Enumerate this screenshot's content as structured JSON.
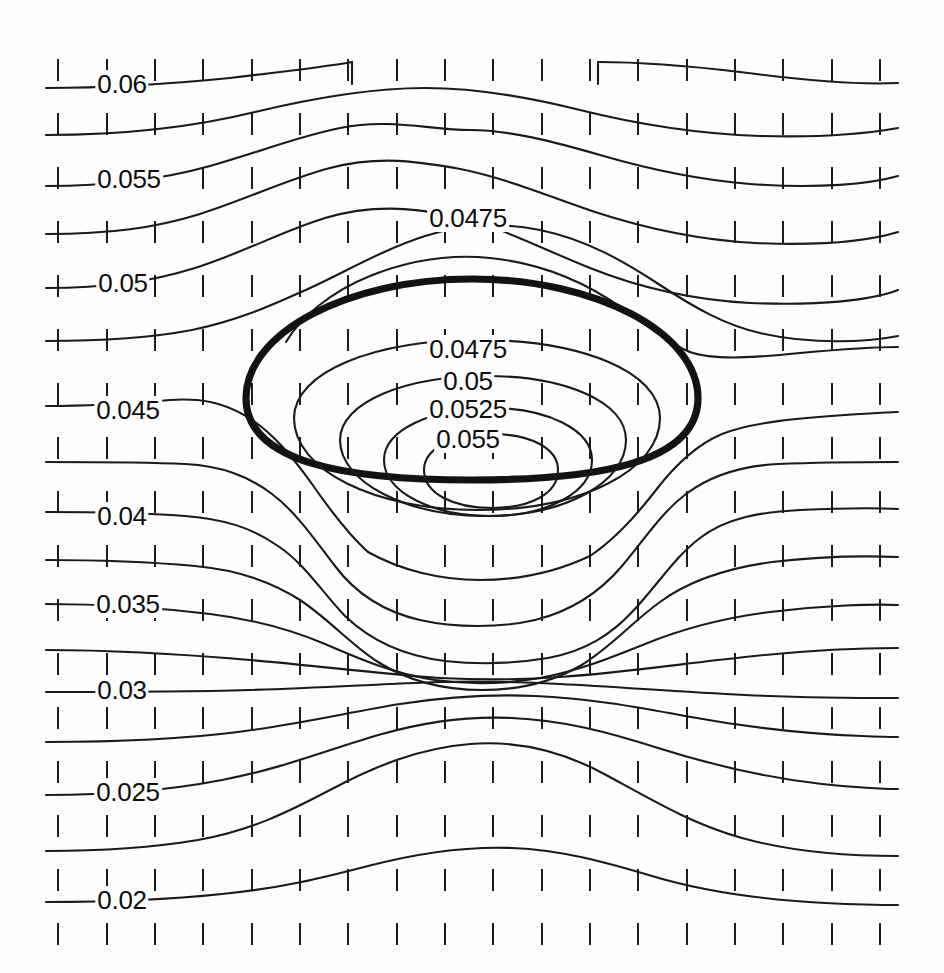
{
  "figure": {
    "type": "contour-plot",
    "background_color": "#fefefe",
    "line_color": "#1a1a1a",
    "bold_line_color": "#121212",
    "width": 944,
    "height": 973
  },
  "labels": [
    {
      "id": "lbl-0060",
      "text": "0.06",
      "x": 122,
      "y": 84,
      "value": 0.06
    },
    {
      "id": "lbl-0055",
      "text": "0.055",
      "x": 129,
      "y": 179,
      "value": 0.055
    },
    {
      "id": "lbl-0475a",
      "text": "0.0475",
      "x": 468,
      "y": 218,
      "value": 0.0475
    },
    {
      "id": "lbl-0050",
      "text": "0.05",
      "x": 123,
      "y": 283,
      "value": 0.05
    },
    {
      "id": "lbl-0475b",
      "text": "0.0475",
      "x": 468,
      "y": 349,
      "value": 0.0475
    },
    {
      "id": "lbl-0050b",
      "text": "0.05",
      "x": 468,
      "y": 381,
      "value": 0.05
    },
    {
      "id": "lbl-0045",
      "text": "0.045",
      "x": 128,
      "y": 410,
      "value": 0.045
    },
    {
      "id": "lbl-0525",
      "text": "0.0525",
      "x": 468,
      "y": 409,
      "value": 0.0525
    },
    {
      "id": "lbl-0550",
      "text": "0.055",
      "x": 468,
      "y": 439,
      "value": 0.055
    },
    {
      "id": "lbl-0040",
      "text": "0.04",
      "x": 122,
      "y": 516,
      "value": 0.04
    },
    {
      "id": "lbl-0035",
      "text": "0.035",
      "x": 128,
      "y": 604,
      "value": 0.035
    },
    {
      "id": "lbl-0030",
      "text": "0.03",
      "x": 122,
      "y": 690,
      "value": 0.03
    },
    {
      "id": "lbl-0025",
      "text": "0.025",
      "x": 128,
      "y": 792,
      "value": 0.025
    },
    {
      "id": "lbl-0020",
      "text": "0.02",
      "x": 122,
      "y": 900,
      "value": 0.02
    }
  ],
  "chart_data": {
    "type": "contour",
    "title": "",
    "xlabel": "",
    "ylabel": "",
    "grid": true,
    "legend": "none",
    "annotation_style": "inline contour labels",
    "levels": [
      0.02,
      0.025,
      0.03,
      0.035,
      0.04,
      0.045,
      0.0475,
      0.05,
      0.0525,
      0.055,
      0.06
    ],
    "level_labels": [
      "0.02",
      "0.025",
      "0.03",
      "0.035",
      "0.04",
      "0.045",
      "0.0475",
      "0.05",
      "0.0525",
      "0.055",
      "0.06"
    ],
    "level_min": 0.02,
    "level_max": 0.055,
    "contour_interval": 0.0025,
    "maximum_value": 0.055,
    "maximum_location_px": [
      490,
      470
    ],
    "highlighted_contour": {
      "style": "bold closed ellipse",
      "center_px": [
        472,
        379
      ],
      "semi_axis_x_px": 226,
      "semi_axis_y_px": 101
    },
    "tick_grid": {
      "columns_px": [
        58,
        107,
        155,
        203,
        252,
        300,
        348,
        397,
        445,
        493,
        542,
        590,
        638,
        687,
        735,
        783,
        832,
        880
      ],
      "rows_px": [
        70,
        124,
        178,
        232,
        286,
        340,
        394,
        448,
        502,
        556,
        610,
        664,
        718,
        772,
        826,
        880,
        934
      ],
      "tick_length_px": 22
    }
  }
}
